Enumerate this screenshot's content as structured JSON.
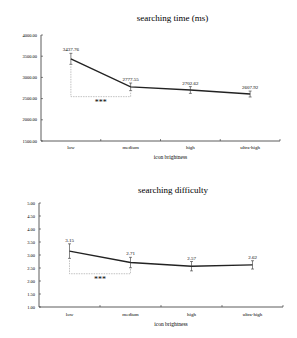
{
  "chart_data": [
    {
      "type": "line",
      "title": "searching time (ms)",
      "xlabel": "icon brightness",
      "ylabel": "",
      "categories": [
        "low",
        "medium",
        "high",
        "ultra-high"
      ],
      "values": [
        3437.76,
        2777.55,
        2702.62,
        2607.92
      ],
      "value_labels": [
        "3437.76",
        "2777.55",
        "2702.62",
        "2607.92"
      ],
      "error_bars": [
        130,
        90,
        80,
        70
      ],
      "ylim": [
        1500,
        4000
      ],
      "yticks": [
        "4000.00",
        "3500.00",
        "3000.00",
        "2500.00",
        "2000.00",
        "1500.00"
      ],
      "annotation": {
        "between": [
          "low",
          "medium"
        ],
        "text": "***"
      },
      "grid": false,
      "legend": null
    },
    {
      "type": "line",
      "title": "searching difficulty",
      "xlabel": "icon brightness",
      "ylabel": "",
      "categories": [
        "low",
        "medium",
        "high",
        "ultra-high"
      ],
      "values": [
        3.15,
        2.71,
        2.57,
        2.62
      ],
      "value_labels": [
        "3.15",
        "2.71",
        "2.57",
        "2.62"
      ],
      "error_bars": [
        0.28,
        0.2,
        0.18,
        0.16
      ],
      "ylim": [
        1.0,
        5.0
      ],
      "yticks": [
        "5.00",
        "4.50",
        "4.00",
        "3.50",
        "3.00",
        "2.50",
        "2.00",
        "1.50",
        "1.00"
      ],
      "annotation": {
        "between": [
          "low",
          "medium"
        ],
        "text": "***"
      },
      "grid": false,
      "legend": null
    }
  ]
}
